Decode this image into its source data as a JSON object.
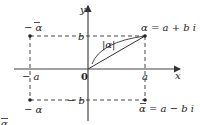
{
  "diagram": {
    "type": "complex-plane",
    "axes": {
      "x_label": "x",
      "y_label": "y",
      "origin_label": "0"
    },
    "tick_labels": {
      "pos_a": "a",
      "neg_a": "− a",
      "pos_b": "b",
      "neg_b": "− b"
    },
    "points": {
      "alpha": "α = a + b i",
      "alpha_conj": "α = a − b i",
      "neg_alpha_conj": "− α",
      "neg_alpha": "− α"
    },
    "modulus_label": "|α|",
    "partial_label": "α"
  }
}
